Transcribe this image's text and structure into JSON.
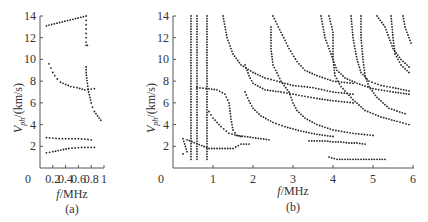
{
  "chart_data": [
    {
      "type": "scatter",
      "panel_label": "(a)",
      "xlabel": "f/MHz",
      "ylabel": "V_ph/(km/s)",
      "xlim": [
        0,
        1
      ],
      "ylim": [
        0,
        14
      ],
      "xticks": [
        "0",
        "0.2",
        "0.4",
        "0.6",
        "0.8",
        "1"
      ],
      "yticks": [
        "2",
        "4",
        "6",
        "8",
        "10",
        "12",
        "14"
      ],
      "grid": false,
      "series": [
        {
          "name": "mode-top",
          "points": [
            [
              0.1,
              13.1
            ],
            [
              0.72,
              14
            ],
            [
              0.72,
              13.6
            ],
            [
              0.72,
              13.2
            ],
            [
              0.72,
              12.8
            ],
            [
              0.72,
              12.4
            ],
            [
              0.72,
              12.0
            ],
            [
              0.72,
              11.6
            ],
            [
              0.72,
              11.3
            ],
            [
              0.74,
              11.3
            ]
          ]
        },
        {
          "name": "mode-decay",
          "points": [
            [
              0.14,
              9.6
            ],
            [
              0.17,
              9.2
            ],
            [
              0.2,
              8.8
            ],
            [
              0.23,
              8.5
            ],
            [
              0.27,
              8.2
            ],
            [
              0.32,
              7.9
            ],
            [
              0.4,
              7.7
            ],
            [
              0.48,
              7.5
            ],
            [
              0.58,
              7.4
            ],
            [
              0.7,
              7.2
            ],
            [
              0.85,
              7.3
            ]
          ]
        },
        {
          "name": "mode-steep",
          "points": [
            [
              0.72,
              9.3
            ],
            [
              0.72,
              8.8
            ],
            [
              0.73,
              8.3
            ],
            [
              0.74,
              7.8
            ],
            [
              0.76,
              7.0
            ],
            [
              0.78,
              6.5
            ],
            [
              0.8,
              6.0
            ],
            [
              0.82,
              5.6
            ],
            [
              0.85,
              5.2
            ],
            [
              0.9,
              4.8
            ],
            [
              0.95,
              4.4
            ]
          ]
        },
        {
          "name": "mode-low-1",
          "points": [
            [
              0.1,
              2.8
            ],
            [
              0.2,
              2.75
            ],
            [
              0.3,
              2.7
            ],
            [
              0.4,
              2.7
            ],
            [
              0.5,
              2.7
            ],
            [
              0.6,
              2.7
            ],
            [
              0.7,
              2.65
            ],
            [
              0.8,
              2.6
            ]
          ]
        },
        {
          "name": "mode-low-2",
          "points": [
            [
              0.1,
              1.4
            ],
            [
              0.2,
              1.5
            ],
            [
              0.45,
              1.8
            ],
            [
              0.55,
              1.85
            ],
            [
              0.65,
              1.9
            ],
            [
              0.75,
              1.9
            ],
            [
              0.85,
              1.9
            ]
          ]
        }
      ]
    },
    {
      "type": "scatter",
      "panel_label": "(b)",
      "xlabel": "f/MHz",
      "ylabel": "V_ph/(km/s)",
      "xlim": [
        0,
        6
      ],
      "ylim": [
        0,
        14
      ],
      "xticks": [
        "0",
        "1",
        "2",
        "3",
        "4",
        "5",
        "6"
      ],
      "yticks": [
        "2",
        "4",
        "6",
        "8",
        "10",
        "12",
        "14"
      ],
      "grid": false,
      "series": [
        {
          "name": "vertical-0.45",
          "x": 0.45,
          "yrange": [
            0.8,
            14
          ]
        },
        {
          "name": "vertical-0.6",
          "x": 0.6,
          "yrange": [
            0.8,
            14
          ]
        },
        {
          "name": "vertical-0.85",
          "x": 0.85,
          "yrange": [
            0.8,
            14
          ]
        },
        {
          "name": "curve-1",
          "points": [
            [
              1.25,
              14
            ],
            [
              1.35,
              12
            ],
            [
              1.5,
              10.5
            ],
            [
              1.7,
              9.5
            ],
            [
              2.0,
              8.8
            ],
            [
              2.3,
              8.3
            ],
            [
              2.6,
              8.0
            ],
            [
              3.0,
              7.6
            ],
            [
              3.5,
              7.4
            ],
            [
              4.0,
              7.0
            ],
            [
              4.5,
              6.8
            ]
          ]
        },
        {
          "name": "curve-2",
          "points": [
            [
              0.6,
              7.4
            ],
            [
              0.9,
              7.3
            ],
            [
              1.1,
              7.2
            ],
            [
              1.3,
              6.8
            ],
            [
              1.4,
              6.0
            ],
            [
              1.45,
              4.5
            ],
            [
              1.5,
              3.5
            ],
            [
              1.6,
              3.0
            ],
            [
              2.0,
              2.8
            ],
            [
              2.4,
              2.6
            ]
          ]
        },
        {
          "name": "curve-3",
          "points": [
            [
              0.9,
              5.2
            ],
            [
              1.0,
              4.6
            ],
            [
              1.2,
              3.8
            ],
            [
              1.4,
              3.2
            ],
            [
              1.7,
              2.9
            ]
          ]
        },
        {
          "name": "curve-4",
          "points": [
            [
              1.8,
              7.0
            ],
            [
              1.9,
              6.2
            ],
            [
              2.0,
              5.5
            ],
            [
              2.2,
              4.8
            ],
            [
              2.5,
              4.2
            ],
            [
              2.8,
              3.8
            ],
            [
              3.2,
              3.4
            ],
            [
              3.6,
              3.1
            ],
            [
              4.0,
              2.9
            ]
          ]
        },
        {
          "name": "curve-5",
          "points": [
            [
              1.8,
              9.5
            ],
            [
              1.9,
              8.5
            ],
            [
              2.0,
              7.8
            ],
            [
              2.3,
              7.2
            ],
            [
              2.7,
              7.0
            ],
            [
              3.0,
              6.8
            ],
            [
              3.3,
              6.6
            ],
            [
              3.6,
              6.4
            ],
            [
              4.0,
              6.2
            ],
            [
              4.5,
              6.0
            ]
          ]
        },
        {
          "name": "curve-6",
          "points": [
            [
              2.5,
              14
            ],
            [
              2.7,
              12.5
            ],
            [
              2.9,
              11.0
            ],
            [
              3.1,
              9.8
            ],
            [
              3.3,
              9.0
            ],
            [
              3.6,
              8.5
            ],
            [
              4.0,
              8.0
            ],
            [
              4.5,
              7.8
            ]
          ]
        },
        {
          "name": "curve-7",
          "points": [
            [
              2.45,
              13
            ],
            [
              2.45,
              11
            ],
            [
              2.5,
              9.5
            ],
            [
              2.7,
              8.0
            ],
            [
              2.9,
              7.0
            ],
            [
              3.0,
              6.0
            ],
            [
              3.1,
              5.3
            ],
            [
              3.3,
              4.6
            ],
            [
              3.6,
              4.0
            ],
            [
              4.0,
              3.5
            ],
            [
              4.5,
              3.2
            ],
            [
              5.0,
              3.0
            ]
          ]
        },
        {
          "name": "curve-8",
          "points": [
            [
              3.7,
              14
            ],
            [
              3.8,
              12
            ],
            [
              3.95,
              10.5
            ],
            [
              4.1,
              9
            ],
            [
              4.3,
              8.3
            ],
            [
              4.6,
              7.8
            ],
            [
              5.0,
              7.3
            ],
            [
              5.5,
              7.0
            ],
            [
              5.9,
              6.8
            ]
          ]
        },
        {
          "name": "curve-9",
          "points": [
            [
              3.9,
              14
            ],
            [
              4.0,
              12.5
            ],
            [
              4.0,
              10
            ],
            [
              4.05,
              8.5
            ],
            [
              4.2,
              7.5
            ],
            [
              4.5,
              6.3
            ],
            [
              4.8,
              5.3
            ],
            [
              5.2,
              4.7
            ],
            [
              5.6,
              4.3
            ],
            [
              5.9,
              4.0
            ]
          ]
        },
        {
          "name": "curve-10",
          "points": [
            [
              4.45,
              14
            ],
            [
              4.5,
              12
            ],
            [
              4.6,
              10
            ],
            [
              4.7,
              8.8
            ],
            [
              4.9,
              8.0
            ],
            [
              5.2,
              7.6
            ],
            [
              5.5,
              7.4
            ],
            [
              5.9,
              7.1
            ]
          ]
        },
        {
          "name": "curve-11",
          "points": [
            [
              4.7,
              14
            ],
            [
              4.7,
              12
            ],
            [
              4.75,
              10
            ],
            [
              4.8,
              8.5
            ],
            [
              4.9,
              7.5
            ],
            [
              5.1,
              6.5
            ],
            [
              5.4,
              5.5
            ],
            [
              5.8,
              5.0
            ]
          ]
        },
        {
          "name": "curve-12",
          "points": [
            [
              5.1,
              14
            ],
            [
              5.3,
              13
            ],
            [
              5.4,
              12
            ],
            [
              5.5,
              11
            ],
            [
              5.7,
              10
            ],
            [
              5.9,
              9.3
            ]
          ]
        },
        {
          "name": "curve-13",
          "points": [
            [
              5.45,
              14
            ],
            [
              5.5,
              12
            ],
            [
              5.55,
              10.5
            ],
            [
              5.7,
              9.5
            ],
            [
              5.9,
              8.8
            ]
          ]
        },
        {
          "name": "curve-14",
          "points": [
            [
              5.75,
              14
            ],
            [
              5.8,
              13
            ],
            [
              5.9,
              12
            ],
            [
              5.95,
              11.5
            ]
          ]
        },
        {
          "name": "low-band",
          "points": [
            [
              3.4,
              2.5
            ],
            [
              3.6,
              2.5
            ],
            [
              3.8,
              2.5
            ],
            [
              4.0,
              2.4
            ],
            [
              4.2,
              2.4
            ],
            [
              4.4,
              2.3
            ],
            [
              4.6,
              2.3
            ],
            [
              4.8,
              2.2
            ]
          ]
        },
        {
          "name": "bottom-band",
          "points": [
            [
              3.9,
              1.0
            ],
            [
              4.1,
              0.8
            ],
            [
              4.3,
              0.8
            ],
            [
              4.5,
              0.8
            ],
            [
              4.7,
              0.8
            ],
            [
              4.9,
              0.8
            ],
            [
              5.1,
              0.8
            ],
            [
              5.3,
              0.8
            ]
          ]
        },
        {
          "name": "low-left",
          "points": [
            [
              0.25,
              1.3
            ],
            [
              0.35,
              1.5
            ],
            [
              0.25,
              2.7
            ],
            [
              0.35,
              2.6
            ],
            [
              0.9,
              1.8
            ],
            [
              1.1,
              1.8
            ],
            [
              1.3,
              1.8
            ],
            [
              1.5,
              1.8
            ],
            [
              1.7,
              2.2
            ],
            [
              1.9,
              2.2
            ]
          ]
        }
      ]
    }
  ],
  "panels": {
    "a": {
      "label": "(a)",
      "xlabel_italic": "f",
      "xlabel_rest": "/MHz",
      "ylabel_main": "V",
      "ylabel_sub": "ph",
      "ylabel_rest": "/(km/s)"
    },
    "b": {
      "label": "(b)",
      "xlabel_italic": "f",
      "xlabel_rest": "/MHz",
      "ylabel_main": "V",
      "ylabel_sub": "ph",
      "ylabel_rest": "/(km/s)"
    }
  },
  "ticks": {
    "a_x": [
      "0",
      "0.2",
      "0.4",
      "0.6",
      "0.8",
      "1"
    ],
    "b_x": [
      "0",
      "1",
      "2",
      "3",
      "4",
      "5",
      "6"
    ],
    "y": [
      "2",
      "4",
      "6",
      "8",
      "10",
      "12",
      "14"
    ]
  }
}
